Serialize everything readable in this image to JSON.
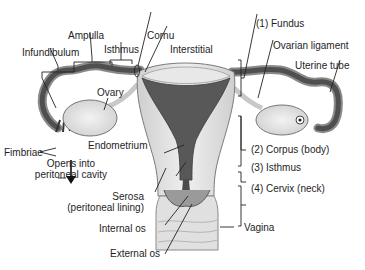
{
  "diagram": {
    "labels": {
      "ampulla": "Ampulla",
      "cornu": "Cornu",
      "infundibulum": "Infundibulum",
      "isthmus_tube": "Isthmus",
      "interstitial": "Interstitial",
      "fundus": "(1) Fundus",
      "ovarian_ligament": "Ovarian ligament",
      "uterine_tube": "Uterine tube",
      "ovary": "Ovary",
      "fimbriae": "Fimbriae",
      "opens_line1": "Opens into",
      "opens_line2": "peritoneal cavity",
      "endometrium": "Endometrium",
      "corpus": "(2) Corpus (body)",
      "isthmus_uterus": "(3) Isthmus",
      "cervix": "(4) Cervix (neck)",
      "serosa_line1": "Serosa",
      "serosa_line2": "(peritoneal lining)",
      "internal_os": "Internal os",
      "vagina": "Vagina",
      "external_os": "External os"
    },
    "colors": {
      "background": "#ffffff",
      "tissue_light": "#e4e4e4",
      "tissue_mid": "#bdbdbd",
      "cavity_dark": "#555555",
      "tube_dark": "#4a4a4a",
      "leader_line": "#222222"
    }
  }
}
